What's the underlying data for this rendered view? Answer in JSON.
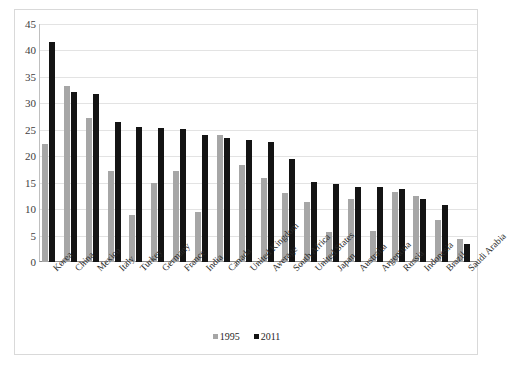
{
  "chart_data": {
    "type": "bar",
    "title": "",
    "subtitle": "",
    "xlabel": "",
    "ylabel": "",
    "ylim": [
      0,
      45
    ],
    "yticks": [
      0,
      5,
      10,
      15,
      20,
      25,
      30,
      35,
      40,
      45
    ],
    "grid": true,
    "legend_position": "bottom",
    "categories": [
      "Korea",
      "China",
      "Mexico",
      "Italy",
      "Turkey",
      "Germany",
      "France",
      "India",
      "Canada",
      "United Kingdom",
      "Average",
      "South Africa",
      "United States",
      "Japan",
      "Australia",
      "Argentina",
      "Russia",
      "Indonesia",
      "Brazil",
      "Saudi Arabia"
    ],
    "series": [
      {
        "name": "1995",
        "color": "#a6a6a6",
        "values": [
          22.3,
          33.2,
          27.2,
          17.2,
          8.9,
          15.0,
          17.3,
          9.4,
          24.1,
          18.3,
          15.9,
          13.1,
          11.4,
          5.6,
          12.0,
          5.8,
          13.3,
          12.5,
          7.9,
          4.4
        ]
      },
      {
        "name": "2011",
        "color": "#141414",
        "values": [
          41.6,
          32.1,
          31.7,
          26.4,
          25.6,
          25.4,
          25.1,
          24.1,
          23.4,
          23.0,
          22.7,
          19.5,
          15.1,
          14.8,
          14.2,
          14.2,
          13.8,
          12.0,
          10.7,
          3.5
        ]
      }
    ]
  },
  "legend": {
    "items": [
      {
        "label": "1995",
        "color": "#a6a6a6"
      },
      {
        "label": "2011",
        "color": "#141414"
      }
    ]
  }
}
